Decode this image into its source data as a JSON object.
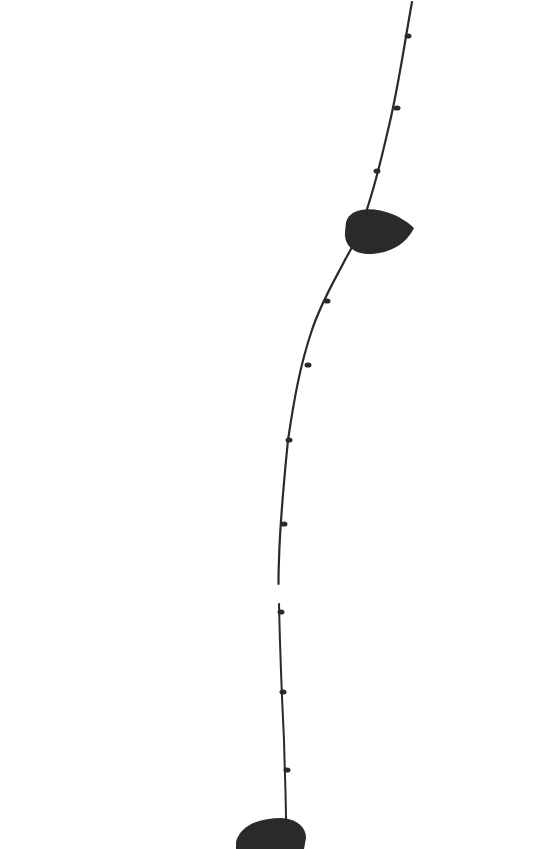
{
  "image": {
    "description": "Black silhouette of a thin vine stem with small nodes and two leaves on a white background",
    "background": "#ffffff",
    "ink": "#2a2a2a",
    "width": 555,
    "height": 849
  },
  "stem": {
    "upper_path": "M412,2 C405,40 398,90 388,130 C380,165 372,195 365,215 C360,232 352,248 346,258 C336,278 322,300 312,330 C300,365 294,400 288,440 C284,480 280,520 279,560 C278.5,570 278.5,578 278.5,584",
    "lower_path": "M279,604 C280,650 282,700 284,740 C285,780 286,800 286,820"
  },
  "nodes": [
    {
      "x": 407,
      "y": 36
    },
    {
      "x": 396,
      "y": 108
    },
    {
      "x": 376,
      "y": 171
    },
    {
      "x": 326,
      "y": 301
    },
    {
      "x": 307,
      "y": 365
    },
    {
      "x": 288,
      "y": 440
    },
    {
      "x": 283,
      "y": 524
    },
    {
      "x": 280,
      "y": 612
    },
    {
      "x": 282,
      "y": 692
    },
    {
      "x": 286,
      "y": 770
    }
  ],
  "leaves": [
    {
      "name": "upper-leaf",
      "path": "M346,222 C350,208 372,206 392,214 C402,218 410,224 414,228 C408,240 396,252 372,254 C352,255 344,244 345,232 Z"
    },
    {
      "name": "lower-leaf",
      "path": "M236,842 C240,826 258,818 282,818 C298,819 306,828 306,838 L304,849 L236,849 Z"
    }
  ]
}
